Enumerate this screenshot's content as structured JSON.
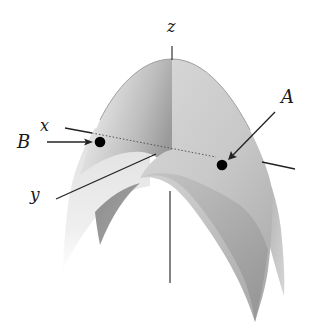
{
  "figure": {
    "surface_color_light": "#e4e4e4",
    "surface_color_mid": "#b5b5b5",
    "surface_color_dark": "#8a8a8a",
    "axis_color": "#222222",
    "point_color": "#000000"
  },
  "labels": {
    "z_axis": "z",
    "x_axis": "x",
    "y_axis": "y",
    "point_a": "A",
    "point_b": "B"
  },
  "points": [
    {
      "name": "A",
      "marker": "filled-circle"
    },
    {
      "name": "B",
      "marker": "filled-circle"
    }
  ]
}
